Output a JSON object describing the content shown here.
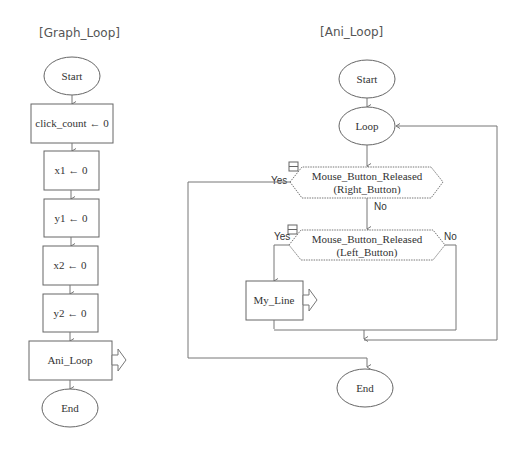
{
  "left_chart": {
    "title": "[Graph_Loop]",
    "nodes": [
      {
        "id": "start",
        "type": "terminal",
        "label": "Start"
      },
      {
        "id": "click_count",
        "type": "process",
        "label": "click_count ← 0"
      },
      {
        "id": "x1",
        "type": "process",
        "label": "x1 ← 0"
      },
      {
        "id": "y1",
        "type": "process",
        "label": "y1 ← 0"
      },
      {
        "id": "x2",
        "type": "process",
        "label": "x2 ← 0"
      },
      {
        "id": "y2",
        "type": "process",
        "label": "y2 ← 0"
      },
      {
        "id": "ani_loop",
        "type": "subroutine-call",
        "label": "Ani_Loop"
      },
      {
        "id": "end",
        "type": "terminal",
        "label": "End"
      }
    ]
  },
  "right_chart": {
    "title": "[Ani_Loop]",
    "nodes": [
      {
        "id": "start",
        "type": "terminal",
        "label": "Start"
      },
      {
        "id": "loop",
        "type": "terminal",
        "label": "Loop"
      },
      {
        "id": "right_check",
        "type": "decision",
        "line1": "Mouse_Button_Released",
        "line2": "(Right_Button)",
        "yes": "Yes",
        "no": "No"
      },
      {
        "id": "left_check",
        "type": "decision",
        "line1": "Mouse_Button_Released",
        "line2": "(Left_Button)",
        "yes": "Yes",
        "no": "No"
      },
      {
        "id": "my_line",
        "type": "subroutine-call",
        "label": "My_Line"
      },
      {
        "id": "end",
        "type": "terminal",
        "label": "End"
      }
    ]
  },
  "colors": {
    "stroke": "#666666",
    "text": "#333333",
    "background": "#ffffff"
  }
}
